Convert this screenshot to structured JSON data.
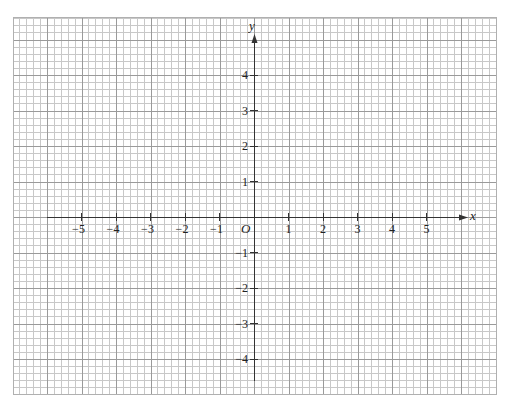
{
  "grid": {
    "left": 13,
    "top": 17,
    "right": 496,
    "bottom": 394,
    "minor_step": 6.9,
    "minor_per_unit": 5,
    "minor_color": "#c8c8c8",
    "major_color": "#9a9a9a",
    "border_color": "#b0b0b0"
  },
  "axes": {
    "origin_px": [
      254,
      217
    ],
    "unit_px_x": 34.5,
    "unit_px_y": 35.5,
    "x_axis": {
      "label": "x",
      "start_px": 47,
      "end_px": 468,
      "ticks": [
        -5,
        -4,
        -3,
        -2,
        -1,
        1,
        2,
        3,
        4,
        5
      ]
    },
    "y_axis": {
      "label": "y",
      "start_px": 381,
      "end_px": 34,
      "ticks": [
        4,
        3,
        2,
        1,
        -1,
        -2,
        -3,
        -4
      ]
    },
    "origin_label": "O",
    "color": "#333333"
  },
  "chart_data": {
    "type": "scatter",
    "title": "",
    "xlabel": "x",
    "ylabel": "y",
    "x_ticks": [
      -5,
      -4,
      -3,
      -2,
      -1,
      1,
      2,
      3,
      4,
      5
    ],
    "y_ticks": [
      -4,
      -3,
      -2,
      -1,
      1,
      2,
      3,
      4
    ],
    "xlim": [
      -6,
      6
    ],
    "ylim": [
      -4.7,
      5
    ],
    "grid": true,
    "origin_label": "O",
    "series": []
  }
}
